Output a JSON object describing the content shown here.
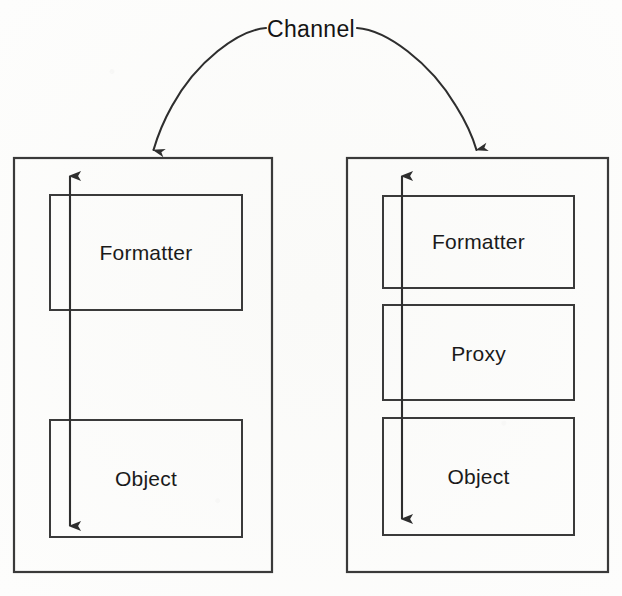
{
  "diagram": {
    "title": "Channel",
    "canvas": {
      "width": 622,
      "height": 596
    },
    "colors": {
      "background": "#fdfdfc",
      "stroke": "#3a3a3a",
      "text": "#1a1a1a"
    },
    "channel": {
      "label": "Channel",
      "arc_left_target": "left-node-top-edge",
      "arc_right_target": "right-node-top-edge"
    },
    "nodes": [
      {
        "id": "left-node",
        "name": "left-participant",
        "box": {
          "x": 14,
          "y": 158,
          "width": 258,
          "height": 414
        },
        "arrow": {
          "name": "left-vertical-bidirectional-arrow",
          "x": 70,
          "y_top": 175,
          "y_bottom": 527,
          "heads": "both"
        },
        "layers": [
          {
            "label": "Formatter",
            "name": "left-formatter-box",
            "box": {
              "x": 50,
              "y": 195,
              "width": 192,
              "height": 115
            }
          },
          {
            "label": "Object",
            "name": "left-object-box",
            "box": {
              "x": 50,
              "y": 420,
              "width": 192,
              "height": 117
            }
          }
        ]
      },
      {
        "id": "right-node",
        "name": "right-participant",
        "box": {
          "x": 347,
          "y": 158,
          "width": 261,
          "height": 414
        },
        "arrow": {
          "name": "right-vertical-bidirectional-arrow",
          "x": 402,
          "y_top": 175,
          "y_bottom": 520,
          "heads": "both"
        },
        "layers": [
          {
            "label": "Formatter",
            "name": "right-formatter-box",
            "box": {
              "x": 383,
              "y": 196,
              "width": 191,
              "height": 92
            }
          },
          {
            "label": "Proxy",
            "name": "right-proxy-box",
            "box": {
              "x": 383,
              "y": 305,
              "width": 191,
              "height": 95
            }
          },
          {
            "label": "Object",
            "name": "right-object-box",
            "box": {
              "x": 383,
              "y": 418,
              "width": 191,
              "height": 117
            }
          }
        ]
      }
    ]
  }
}
